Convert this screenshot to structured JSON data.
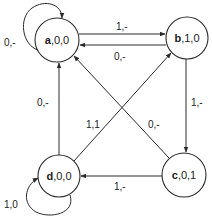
{
  "diagram": {
    "type": "finite-state-machine",
    "states": [
      {
        "id": "a",
        "name": "a",
        "outputs": ",0,0",
        "label": "a,0,0",
        "cx": 57,
        "cy": 40,
        "r": 22
      },
      {
        "id": "b",
        "name": "b",
        "outputs": ",1,0",
        "label": "b,1,0",
        "cx": 187,
        "cy": 38,
        "r": 21
      },
      {
        "id": "c",
        "name": "c",
        "outputs": ",0,1",
        "label": "c,0,1",
        "cx": 184,
        "cy": 175,
        "r": 22
      },
      {
        "id": "d",
        "name": "d",
        "outputs": ",0,0",
        "label": "d,0,0",
        "cx": 59,
        "cy": 176,
        "r": 21
      }
    ],
    "transitions": [
      {
        "from": "a",
        "to": "a",
        "label": "0,-"
      },
      {
        "from": "a",
        "to": "b",
        "label": "1,-"
      },
      {
        "from": "b",
        "to": "a",
        "label": "0,-"
      },
      {
        "from": "b",
        "to": "c",
        "label": "1,-"
      },
      {
        "from": "c",
        "to": "a",
        "label": "0,-"
      },
      {
        "from": "c",
        "to": "d",
        "label": "1,-"
      },
      {
        "from": "d",
        "to": "a",
        "label": "0,-"
      },
      {
        "from": "d",
        "to": "b",
        "label": "1,1"
      },
      {
        "from": "d",
        "to": "d",
        "label": "1,0"
      }
    ]
  }
}
